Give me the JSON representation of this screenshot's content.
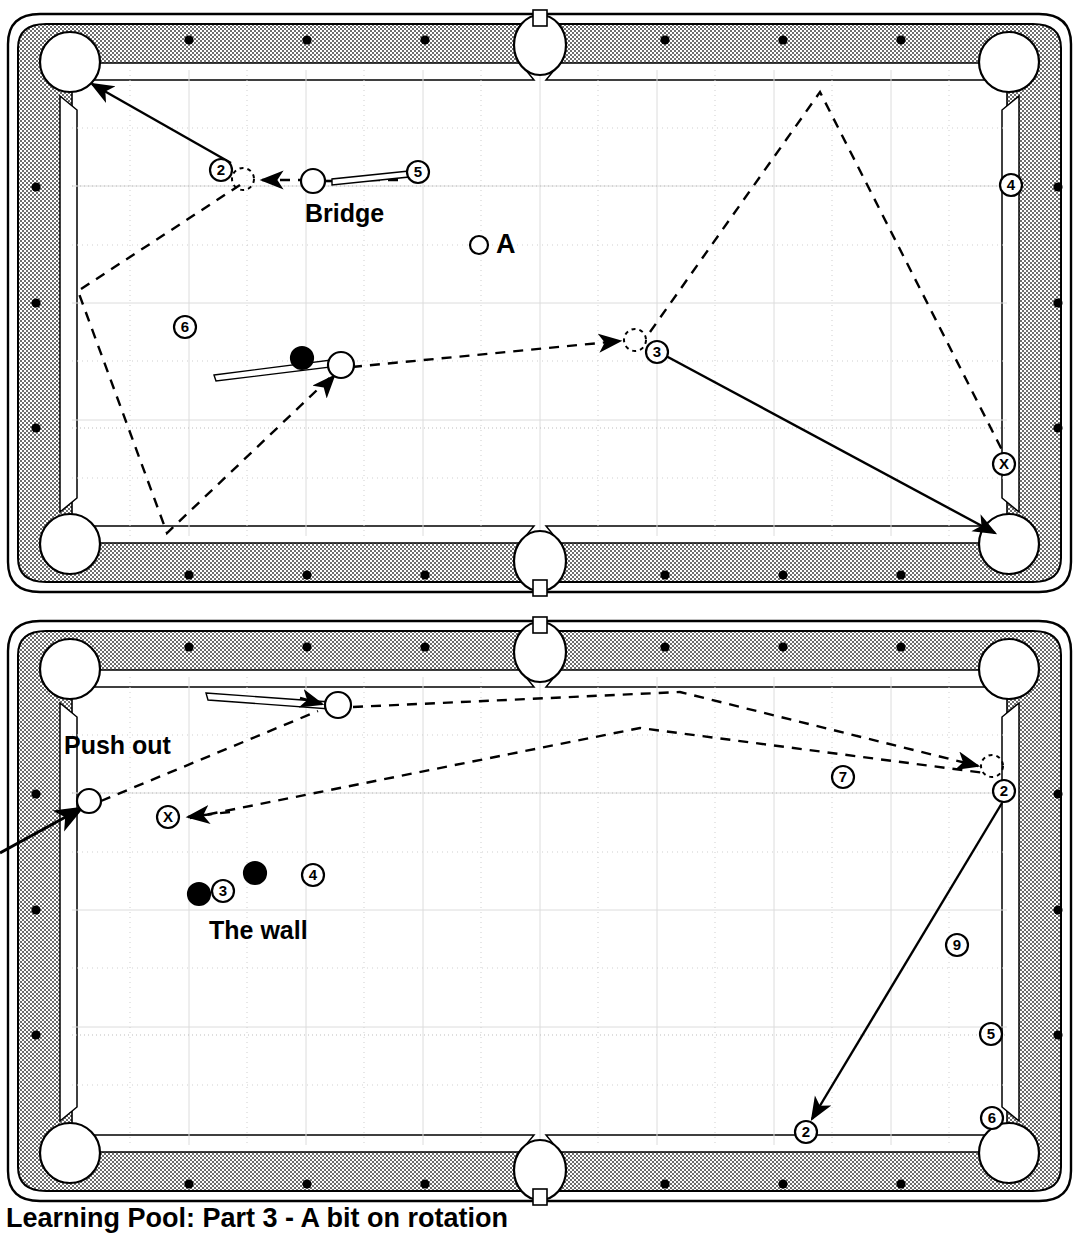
{
  "page": {
    "caption_bottom": "Learning Pool: Part 3 - A bit on rotation"
  },
  "colors": {
    "rail": "#9d9d9d",
    "cloth": "#ffffff",
    "line": "#000000",
    "grid": "#d8d8d8",
    "grid_strong": "#bdbdbd"
  },
  "diagrams": [
    {
      "id": "top-table",
      "name": "Diagram 1 - Bridge shot",
      "labels": [
        {
          "text": "Bridge",
          "x": 305,
          "y": 215,
          "size": 25
        },
        {
          "text": "A",
          "x": 497,
          "y": 247,
          "size": 27
        }
      ],
      "cue_balls": [
        {
          "name": "cue-ball-bridge",
          "x": 313,
          "y": 181,
          "r": 12
        },
        {
          "name": "cue-ball-ten",
          "x": 341,
          "y": 365,
          "r": 13
        },
        {
          "name": "ball-A",
          "x": 479,
          "y": 245,
          "r": 9
        },
        {
          "name": "ghost-ball-2",
          "x": 243,
          "y": 179,
          "r": 11,
          "ghost": true
        },
        {
          "name": "ghost-ball-3",
          "x": 635,
          "y": 340,
          "r": 11,
          "ghost": true
        }
      ],
      "numbered_balls": [
        {
          "label": "2",
          "x": 221,
          "y": 170,
          "r": 11,
          "filled": false
        },
        {
          "label": "5",
          "x": 418,
          "y": 172,
          "r": 11,
          "filled": false
        },
        {
          "label": "4",
          "x": 1011,
          "y": 185,
          "r": 11,
          "filled": false
        },
        {
          "label": "6",
          "x": 185,
          "y": 327,
          "r": 11,
          "filled": false
        },
        {
          "label": "10",
          "x": 302,
          "y": 358,
          "r": 11,
          "filled": true
        },
        {
          "label": "3",
          "x": 657,
          "y": 352,
          "r": 11,
          "filled": false
        },
        {
          "label": "X",
          "x": 1004,
          "y": 464,
          "r": 11,
          "filled": false
        }
      ]
    },
    {
      "id": "bottom-table",
      "name": "Diagram 2 - Push out and the wall",
      "labels": [
        {
          "text": "Push out",
          "x": 65,
          "y": 748,
          "size": 25
        },
        {
          "text": "The wall",
          "x": 210,
          "y": 934,
          "size": 25
        }
      ],
      "cue_balls": [
        {
          "name": "cue-ball-push",
          "x": 338,
          "y": 705,
          "r": 13
        },
        {
          "name": "cue-ball-left",
          "x": 89,
          "y": 801,
          "r": 12
        },
        {
          "name": "ghost-ball-2",
          "x": 992,
          "y": 766,
          "r": 11,
          "ghost": true
        }
      ],
      "numbered_balls": [
        {
          "label": "X",
          "x": 168,
          "y": 817,
          "r": 11,
          "filled": false
        },
        {
          "label": "7",
          "x": 843,
          "y": 777,
          "r": 11,
          "filled": false
        },
        {
          "label": "2",
          "x": 1004,
          "y": 791,
          "r": 11,
          "filled": false
        },
        {
          "label": "8",
          "x": 255,
          "y": 873,
          "r": 11,
          "filled": true
        },
        {
          "label": "4",
          "x": 313,
          "y": 875,
          "r": 11,
          "filled": false
        },
        {
          "label": "10",
          "x": 199,
          "y": 894,
          "r": 11,
          "filled": true
        },
        {
          "label": "3",
          "x": 223,
          "y": 891,
          "r": 11,
          "filled": false
        },
        {
          "label": "9",
          "x": 957,
          "y": 945,
          "r": 11,
          "filled": false
        },
        {
          "label": "5",
          "x": 991,
          "y": 1034,
          "r": 11,
          "filled": false
        },
        {
          "label": "6",
          "x": 992,
          "y": 1118,
          "r": 11,
          "filled": false
        },
        {
          "label": "2",
          "x": 806,
          "y": 1132,
          "r": 11,
          "filled": false
        }
      ]
    }
  ],
  "icon_names": [
    "cue-stick-icon",
    "cue-ball-icon",
    "ghost-ball-icon",
    "pocket-icon",
    "diamond-marker-icon",
    "solid-path-arrow-icon",
    "dashed-path-arrow-icon"
  ]
}
